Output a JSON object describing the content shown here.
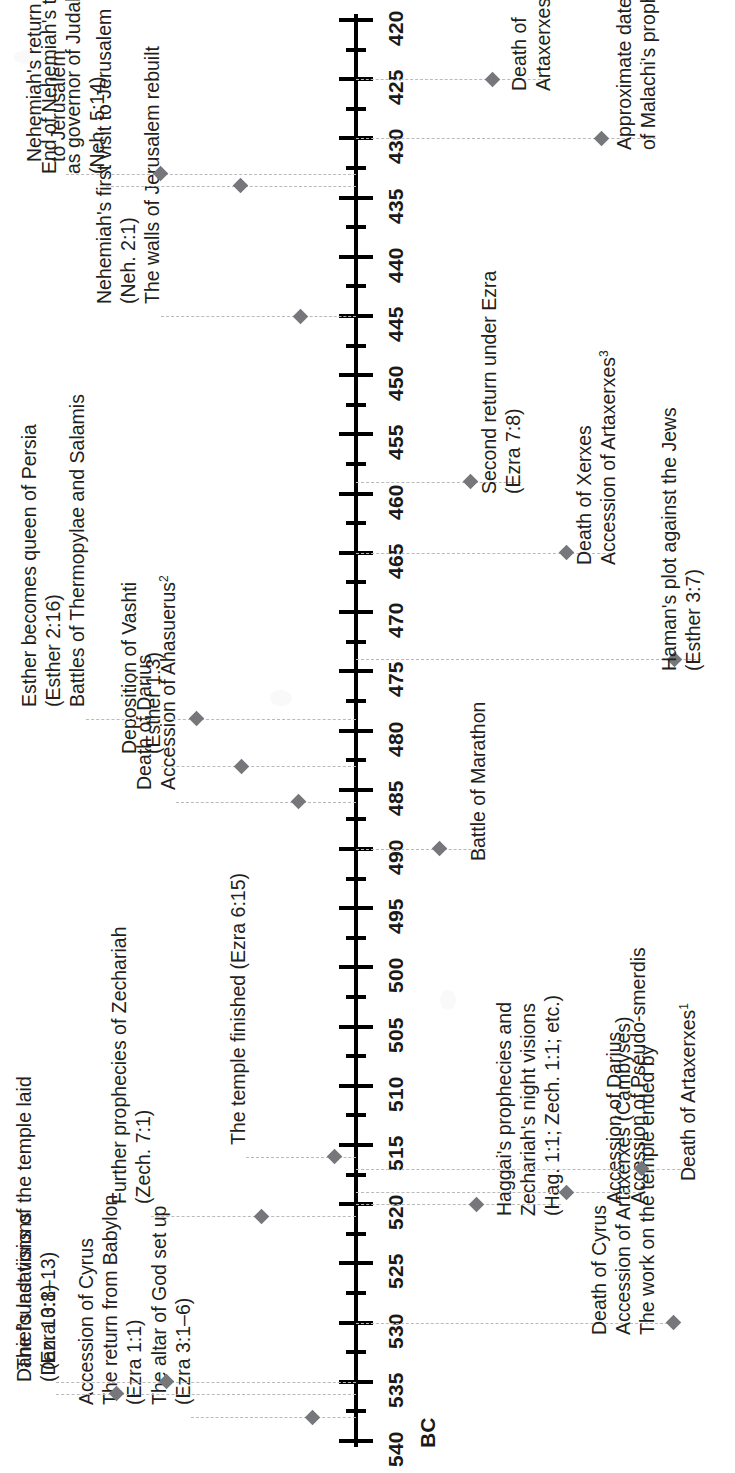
{
  "figure": {
    "kind": "historical-timeline",
    "orientation": "rotated-90-ccw",
    "era_label": "BC"
  },
  "axis": {
    "unit": "BC",
    "start": 540,
    "end": 420,
    "direction": "descending",
    "major_step": 5,
    "minor_step": 2.5,
    "tick_labels": [
      "540",
      "535",
      "530",
      "525",
      "520",
      "515",
      "510",
      "505",
      "500",
      "495",
      "490",
      "485",
      "480",
      "475",
      "470",
      "465",
      "460",
      "455",
      "450",
      "445",
      "440",
      "435",
      "430",
      "425",
      "420"
    ]
  },
  "colors": {
    "marker": "#76777a",
    "leader": "#b9babc",
    "axis": "#000000",
    "text": "#231f20"
  },
  "chart_data": {
    "type": "timeline",
    "title": "",
    "xlabel": "BC",
    "ylabel": "",
    "xlim": [
      540,
      420
    ],
    "grid": false,
    "legend": "none",
    "events": [
      {
        "year": 538,
        "side": "left",
        "lines": [
          "Accession of Cyrus",
          "The return from Babylon",
          "(Ezra 1:1)",
          "The altar of God set up",
          "(Ezra 3:1–6)"
        ]
      },
      {
        "year": 535,
        "side": "left",
        "lines": [
          "The foundations of the temple laid",
          "(Ezra 3:8–13)"
        ]
      },
      {
        "year": 530,
        "side": "right",
        "lines": [
          "Death of Cyrus",
          "Accession of Artaxerxes (Cambyses)",
          "The work on the temple ended by"
        ]
      },
      {
        "year": 536,
        "side": "left",
        "lines": [
          "Daniel's last visions",
          "(Dan. 10:1)"
        ]
      },
      {
        "year": 521,
        "side": "left",
        "lines": [
          "Further prophecies of Zechariah",
          "(Zech. 7:1)"
        ]
      },
      {
        "year": 516,
        "side": "left",
        "lines": [
          "The temple finished (Ezra 6:15)"
        ]
      },
      {
        "year": 520,
        "side": "right",
        "lines": [
          "Haggai's prophecies and",
          "Zechariah's night visions",
          "(Hag. 1:1; Zech. 1:1; etc.)"
        ]
      },
      {
        "year": 519,
        "side": "right",
        "lines": [
          "Accession of Darius",
          "Accession of Pseudo-smerdis"
        ]
      },
      {
        "year": 517,
        "side": "right",
        "lines": [
          "Death of Artaxerxes<sup>1</sup>"
        ]
      },
      {
        "year": 490,
        "side": "right",
        "lines": [
          "Battle of Marathon"
        ]
      },
      {
        "year": 486,
        "side": "left",
        "lines": [
          "Death of Darius",
          "Accession of Ahasuerus<sup>2</sup>"
        ]
      },
      {
        "year": 483,
        "side": "left",
        "lines": [
          "Deposition of Vashti",
          "(Esther 1:3)"
        ]
      },
      {
        "year": 479,
        "side": "left",
        "lines": [
          "Esther becomes queen of Persia",
          "(Esther 2:16)",
          "Battles of Thermopylae and Salamis"
        ]
      },
      {
        "year": 474,
        "side": "right",
        "lines": [
          "Haman's plot against the Jews",
          "(Esther 3:7)"
        ]
      },
      {
        "year": 465,
        "side": "right",
        "lines": [
          "Death of Xerxes",
          "Accession of Artaxerxes<sup>3</sup>"
        ]
      },
      {
        "year": 459,
        "side": "right",
        "lines": [
          "Second return under Ezra",
          "(Ezra 7:8)"
        ]
      },
      {
        "year": 445,
        "side": "left",
        "lines": [
          "Nehemiah's first visit to Jerusalem",
          "(Neh. 2:1)",
          "The walls of Jerusalem rebuilt"
        ]
      },
      {
        "year": 434,
        "side": "left",
        "lines": [
          "End of Nehemiah's term",
          "as governor of Judah",
          "(Neh. 5:14)"
        ]
      },
      {
        "year": 433,
        "side": "left",
        "lines": [
          "Nehemiah's return",
          "to Jerusalem"
        ]
      },
      {
        "year": 430,
        "side": "right",
        "lines": [
          "Approximate date",
          "of Malachi's prophecy"
        ]
      },
      {
        "year": 425,
        "side": "right",
        "lines": [
          "Death of",
          "Artaxerxes"
        ]
      }
    ]
  }
}
